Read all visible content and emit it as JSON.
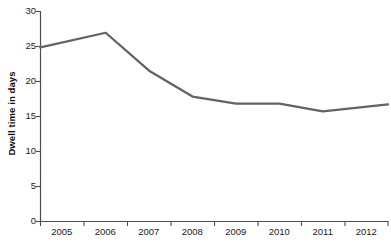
{
  "chart_data": {
    "type": "line",
    "title": "",
    "xlabel": "",
    "ylabel": "Dwell time in days",
    "categories": [
      "2005",
      "2006",
      "2007",
      "2008",
      "2009",
      "2010",
      "2011",
      "2012"
    ],
    "values": [
      24.8,
      26.9,
      21.5,
      17.8,
      16.8,
      16.8,
      15.7,
      16.7
    ],
    "series": [
      {
        "name": "Dwell time",
        "values": [
          24.8,
          26.9,
          21.5,
          17.8,
          16.8,
          16.8,
          15.7,
          16.7
        ],
        "color": "#636363"
      }
    ],
    "ylim": [
      0,
      30
    ],
    "yticks": [
      0,
      5,
      10,
      15,
      20,
      25,
      30
    ],
    "ytick_labels": [
      "0",
      "5",
      "10",
      "15",
      "20",
      "25",
      "30"
    ],
    "xtick_labels": [
      "2005",
      "2006",
      "2007",
      "2008",
      "2009",
      "2010",
      "2011",
      "2012"
    ],
    "grid": false,
    "legend": false,
    "legend_position": "none"
  },
  "axes": {
    "y_title": "Dwell time in days",
    "tick_color": "#4d4d4d",
    "line_color": "#4d4d4d",
    "text_color": "#1a1a1a"
  }
}
